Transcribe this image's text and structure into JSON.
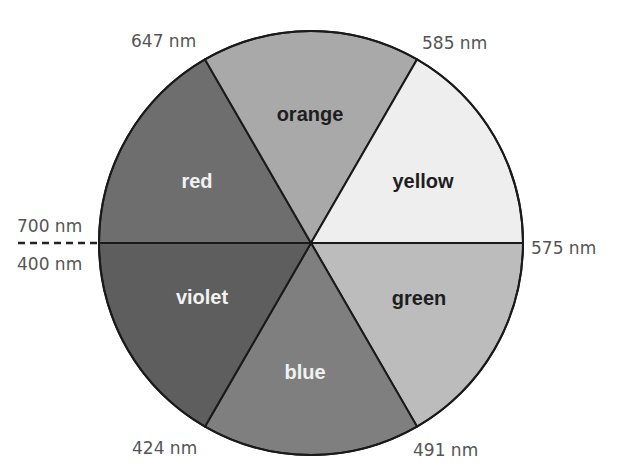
{
  "chart_data": {
    "type": "pie",
    "title": "",
    "center": [
      311,
      243
    ],
    "radius": 212,
    "slices": [
      {
        "name": "red",
        "from_deg": 180,
        "to_deg": 240,
        "fill": "#6e6e6e",
        "label_color": "light",
        "label_pos": [
          197,
          183
        ]
      },
      {
        "name": "orange",
        "from_deg": 240,
        "to_deg": 300,
        "fill": "#a9a9a9",
        "label_color": "dark",
        "label_pos": [
          310,
          116
        ]
      },
      {
        "name": "yellow",
        "from_deg": 300,
        "to_deg": 360,
        "fill": "#eeeeee",
        "label_color": "dark",
        "label_pos": [
          423,
          183
        ]
      },
      {
        "name": "green",
        "from_deg": 0,
        "to_deg": 60,
        "fill": "#bcbcbc",
        "label_color": "dark",
        "label_pos": [
          419,
          300
        ]
      },
      {
        "name": "blue",
        "from_deg": 60,
        "to_deg": 120,
        "fill": "#7f7f7f",
        "label_color": "light",
        "label_pos": [
          305,
          374
        ]
      },
      {
        "name": "violet",
        "from_deg": 120,
        "to_deg": 180,
        "fill": "#5e5e5e",
        "label_color": "light",
        "label_pos": [
          202,
          299
        ]
      }
    ],
    "boundary_labels": [
      {
        "text": "647 nm",
        "x": 131,
        "y": 47
      },
      {
        "text": "585 nm",
        "x": 422,
        "y": 49
      },
      {
        "text": "700 nm",
        "x": 17,
        "y": 232
      },
      {
        "text": "400 nm",
        "x": 17,
        "y": 270
      },
      {
        "text": "575 nm",
        "x": 531,
        "y": 254
      },
      {
        "text": "424 nm",
        "x": 132,
        "y": 454
      },
      {
        "text": "491 nm",
        "x": 413,
        "y": 456
      }
    ],
    "dashed_line": {
      "x1": 18,
      "x2": 101,
      "y": 243
    }
  }
}
